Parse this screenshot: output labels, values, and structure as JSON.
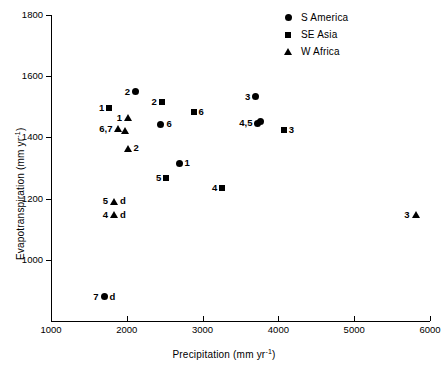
{
  "chart_data": {
    "type": "scatter",
    "title": "",
    "xlabel": "Precipitation (mm yr⁻¹)",
    "ylabel": "Evapotranspiration (mm yr⁻¹)",
    "xlim": [
      1000,
      6000
    ],
    "ylim": [
      800,
      1800
    ],
    "xticks": [
      1000,
      2000,
      3000,
      4000,
      5000,
      6000
    ],
    "yticks": [
      1000,
      1200,
      1400,
      1600,
      1800
    ],
    "xtick_labels": [
      "1000",
      "2000",
      "3000",
      "4000",
      "5000",
      "6000"
    ],
    "ytick_labels": [
      "1000",
      "1200",
      "1400",
      "1600",
      "1800"
    ],
    "grid": false,
    "legend_position": "top-right",
    "legend": [
      {
        "label": "S America",
        "marker": "circle"
      },
      {
        "label": "SE Asia",
        "marker": "square"
      },
      {
        "label": "W Africa",
        "marker": "triangle"
      }
    ],
    "series": [
      {
        "name": "S America",
        "marker": "circle",
        "points": [
          {
            "label": "2",
            "x": 2115,
            "y": 1550,
            "label_side": "left"
          },
          {
            "label": "6",
            "x": 2450,
            "y": 1443,
            "label_side": "right"
          },
          {
            "label": "1",
            "x": 2690,
            "y": 1315,
            "label_side": "right"
          },
          {
            "label": "3",
            "x": 3700,
            "y": 1533,
            "label_side": "left"
          },
          {
            "label": "4,5",
            "x": 3730,
            "y": 1447,
            "label_side": "left"
          },
          {
            "label": "",
            "x": 3760,
            "y": 1452,
            "label_side": "none"
          },
          {
            "label": "7",
            "x": 1700,
            "y": 880,
            "label_side": "left",
            "suffix": "d"
          }
        ]
      },
      {
        "name": "SE Asia",
        "marker": "square",
        "points": [
          {
            "label": "1",
            "x": 1770,
            "y": 1497,
            "label_side": "left"
          },
          {
            "label": "2",
            "x": 2460,
            "y": 1515,
            "label_side": "left"
          },
          {
            "label": "6",
            "x": 2880,
            "y": 1482,
            "label_side": "right"
          },
          {
            "label": "3",
            "x": 4070,
            "y": 1423,
            "label_side": "right"
          },
          {
            "label": "5",
            "x": 2520,
            "y": 1268,
            "label_side": "left"
          },
          {
            "label": "4",
            "x": 3260,
            "y": 1235,
            "label_side": "left"
          }
        ]
      },
      {
        "name": "W Africa",
        "marker": "triangle",
        "points": [
          {
            "label": "1",
            "x": 2015,
            "y": 1465,
            "label_side": "left"
          },
          {
            "label": "6,7",
            "x": 1890,
            "y": 1428,
            "label_side": "left"
          },
          {
            "label": "",
            "x": 1975,
            "y": 1424,
            "label_side": "none"
          },
          {
            "label": "2",
            "x": 2010,
            "y": 1365,
            "label_side": "right"
          },
          {
            "label": "5",
            "x": 1830,
            "y": 1192,
            "label_side": "left",
            "suffix": "d"
          },
          {
            "label": "4",
            "x": 1830,
            "y": 1147,
            "label_side": "left",
            "suffix": "d"
          },
          {
            "label": "3",
            "x": 5810,
            "y": 1148,
            "label_side": "left"
          }
        ]
      }
    ]
  }
}
